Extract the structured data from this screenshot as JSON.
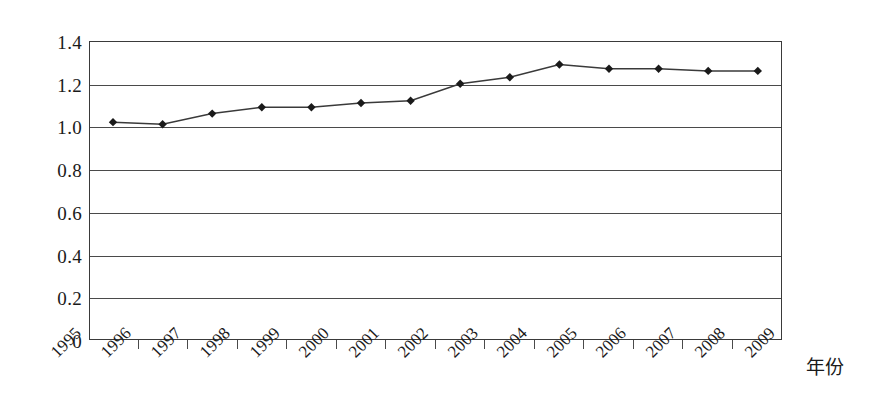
{
  "chart_data": {
    "type": "line",
    "title": "",
    "subtitle": "",
    "xlabel": "年份",
    "ylabel": "",
    "categories": [
      "1995",
      "1996",
      "1997",
      "1998",
      "1999",
      "2000",
      "2001",
      "2002",
      "2003",
      "2004",
      "2005",
      "2006",
      "2007",
      "2008",
      "2009"
    ],
    "x": [
      1995,
      1996,
      1997,
      1998,
      1999,
      2000,
      2001,
      2002,
      2003,
      2004,
      2005,
      2006,
      2007,
      2008,
      2009
    ],
    "values": [
      1.02,
      1.01,
      1.06,
      1.09,
      1.09,
      1.11,
      1.12,
      1.2,
      1.23,
      1.29,
      1.27,
      1.27,
      1.26,
      1.26,
      null
    ],
    "series": [
      {
        "name": "series-1",
        "marker": "diamond",
        "color": "#3a3a3a",
        "values": [
          1.02,
          1.01,
          1.06,
          1.09,
          1.09,
          1.11,
          1.12,
          1.2,
          1.23,
          1.29,
          1.27,
          1.27,
          1.26,
          1.26,
          null
        ]
      }
    ],
    "ylim": [
      0,
      1.4
    ],
    "ytick_values": [
      0,
      0.2,
      0.4,
      0.6,
      0.8,
      1.0,
      1.2,
      1.4
    ],
    "ytick_labels": [
      "0",
      "0.2",
      "0.4",
      "0.6",
      "0.8",
      "1.0",
      "1.2",
      "1.4"
    ],
    "xtick_labels": [
      "1995",
      "1996",
      "1997",
      "1998",
      "1999",
      "2000",
      "2001",
      "2002",
      "2003",
      "2004",
      "2005",
      "2006",
      "2007",
      "2008",
      "2009"
    ],
    "grid": "horizontal",
    "legend": "none",
    "xtick_label_rotation": -45,
    "line_color": "#3a3a3a",
    "marker_color": "#1a1a1a",
    "frame_color": "#3a3a3a",
    "background": "#ffffff"
  }
}
